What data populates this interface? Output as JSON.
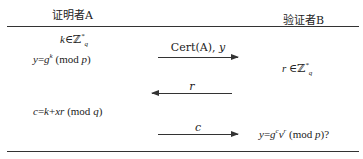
{
  "parties": {
    "prover": "证明者A",
    "verifier": "验证者B"
  },
  "prover_steps": [
    {
      "text": "k∈ℤ",
      "sup": "*",
      "sub": "q"
    },
    {
      "text": "y=g",
      "sup": "k",
      "after": " (mod p)"
    },
    {
      "text": "c=k+xr (mod q)"
    }
  ],
  "verifier_steps": [
    {
      "text": "r∈ℤ",
      "sup": "*",
      "sub": "q"
    },
    {
      "text": "y=g",
      "sup": "c",
      "mid": "v",
      "sup2": "r",
      "after": " (mod p)?"
    }
  ],
  "messages": [
    {
      "label": "Cert(A), y",
      "direction": "right"
    },
    {
      "label": "r",
      "direction": "left"
    },
    {
      "label": "c",
      "direction": "right"
    }
  ]
}
